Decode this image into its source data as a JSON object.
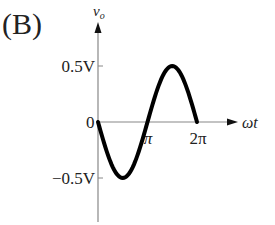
{
  "panel_label": "(B)",
  "axes": {
    "y_label": "v",
    "y_label_sub": "o",
    "x_label": "ωt",
    "origin_label": "0",
    "y_ticks": [
      "0.5V",
      "−0.5V"
    ],
    "x_ticks": [
      "π",
      "2π"
    ]
  },
  "colors": {
    "axis": "#888888",
    "curve": "#000000",
    "text": "#222222"
  },
  "chart_data": {
    "type": "line",
    "title": "(B)",
    "xlabel": "ωt",
    "ylabel": "v_o",
    "x_ticks": [
      "0",
      "π",
      "2π"
    ],
    "y_ticks": [
      "-0.5V",
      "0",
      "0.5V"
    ],
    "xlim": [
      0,
      6.283
    ],
    "ylim": [
      -0.5,
      0.5
    ],
    "series": [
      {
        "name": "v_o = -0.5 sin(ωt)",
        "x": [
          0,
          0.785,
          1.571,
          2.356,
          3.142,
          3.927,
          4.712,
          5.498,
          6.283
        ],
        "y": [
          0,
          -0.354,
          -0.5,
          -0.354,
          0,
          0.354,
          0.5,
          0.354,
          0
        ]
      }
    ]
  }
}
